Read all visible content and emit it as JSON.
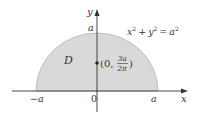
{
  "diagram": {
    "type": "semicircular-region",
    "equation": {
      "lhs_x": "x",
      "lhs_y": "y",
      "rhs": "a",
      "exponent": "2",
      "plus": "+",
      "equals": "="
    },
    "region_label": "D",
    "centroid": {
      "open": "(0,",
      "numerator": "3a",
      "denominator": "2π",
      "close": ")"
    },
    "axes": {
      "x_label": "x",
      "y_label": "y",
      "origin_label": "0",
      "x_neg_tick": "−a",
      "x_pos_tick": "a",
      "y_tick": "a"
    },
    "colors": {
      "fill": "#d9d9d9",
      "stroke": "#aaaaaa",
      "axis": "#333333",
      "text": "#333333"
    }
  }
}
